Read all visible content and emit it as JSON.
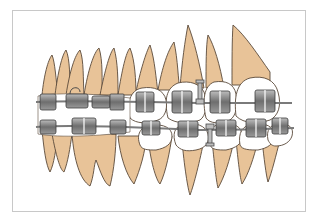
{
  "figure": {
    "colors": {
      "root": "#e8c398",
      "crown": "#ffffff",
      "outline": "#5a4a3a",
      "bracket": "#8a8a8a",
      "bracket_dark": "#4a4a4a",
      "wire": "#7a7a7a",
      "frame": "#c8c8c8"
    },
    "upper_teeth_count": 8,
    "lower_teeth_count": 8
  }
}
